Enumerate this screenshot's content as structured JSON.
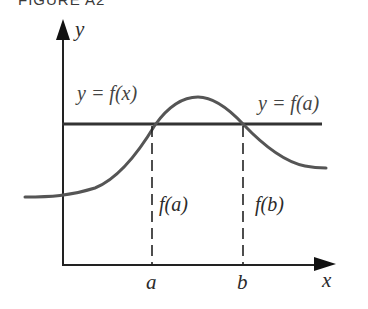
{
  "figure": {
    "title": "FIGURE A2",
    "axes": {
      "x_label": "x",
      "y_label": "y"
    },
    "curve": {
      "label": "y = f(x)",
      "color": "#555555"
    },
    "horizontal_line": {
      "label": "y = f(a)",
      "color": "#333333"
    },
    "markers": [
      {
        "tick": "a",
        "segment_label": "f(a)"
      },
      {
        "tick": "b",
        "segment_label": "f(b)"
      }
    ]
  }
}
